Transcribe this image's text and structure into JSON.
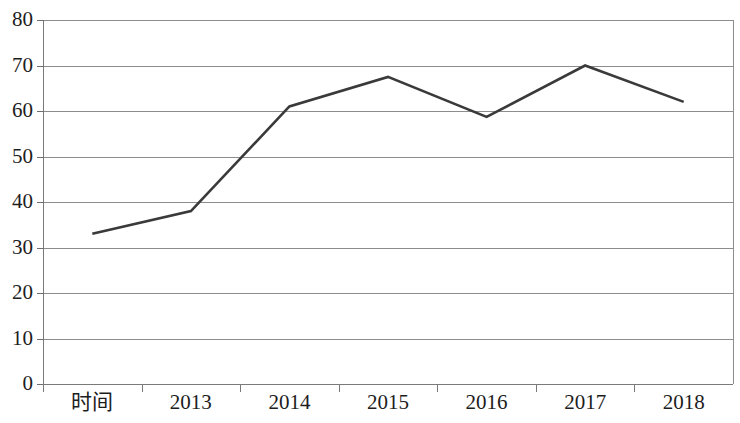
{
  "chart_data": {
    "type": "line",
    "title": "",
    "subtitle": "",
    "xlabel": "",
    "ylabel": "",
    "categories": [
      "时间",
      "2013",
      "2014",
      "2015",
      "2016",
      "2017",
      "2018"
    ],
    "series": [
      {
        "name": "",
        "values": [
          33,
          38,
          61,
          67.5,
          58.7,
          70,
          62
        ]
      }
    ],
    "x_tick_labels": [
      "时间",
      "2013",
      "2014",
      "2015",
      "2016",
      "2017",
      "2018"
    ],
    "y_tick_labels": [
      "0",
      "10",
      "20",
      "30",
      "40",
      "50",
      "60",
      "70",
      "80"
    ],
    "y_ticks": [
      0,
      10,
      20,
      30,
      40,
      50,
      60,
      70,
      80
    ],
    "ylim": [
      0,
      80
    ],
    "grid": "horizontal",
    "legend": "none",
    "line_color": "#3a3a3a",
    "gridline_color": "#8d8d8d",
    "axis_color": "#7a7a7a",
    "background_color": "#ffffff",
    "markers": "none",
    "annotations": []
  },
  "axes": {
    "y_labels": [
      {
        "text": "80",
        "value": 80
      },
      {
        "text": "70",
        "value": 70
      },
      {
        "text": "60",
        "value": 60
      },
      {
        "text": "50",
        "value": 50
      },
      {
        "text": "40",
        "value": 40
      },
      {
        "text": "30",
        "value": 30
      },
      {
        "text": "20",
        "value": 20
      },
      {
        "text": "10",
        "value": 10
      },
      {
        "text": "0",
        "value": 0
      }
    ],
    "x_labels": [
      {
        "text": "时间"
      },
      {
        "text": "2013"
      },
      {
        "text": "2014"
      },
      {
        "text": "2015"
      },
      {
        "text": "2016"
      },
      {
        "text": "2017"
      },
      {
        "text": "2018"
      }
    ]
  }
}
